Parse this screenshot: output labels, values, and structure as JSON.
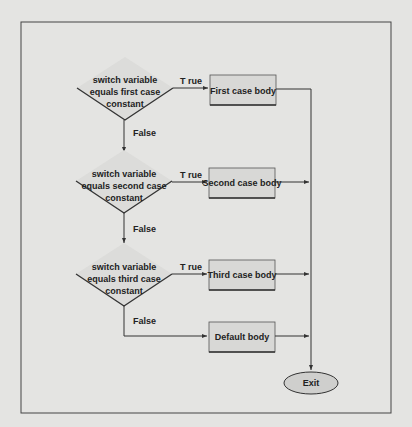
{
  "decisions": [
    {
      "lines": [
        "switch variable",
        "equals first case",
        "constant"
      ],
      "true_label": "T rue",
      "false_label": "False"
    },
    {
      "lines": [
        "switch variable",
        "equals second case",
        "constant"
      ],
      "true_label": "T rue",
      "false_label": "False"
    },
    {
      "lines": [
        "switch variable",
        "equals third case",
        "constant"
      ],
      "true_label": "T rue",
      "false_label": "False"
    }
  ],
  "bodies": [
    "First case body",
    "Second case body",
    "Third case body",
    "Default body"
  ],
  "exit_label": "Exit",
  "colors": {
    "background": "#e4e4e2",
    "line": "#333333",
    "box_fill": "#d8d8d6",
    "ellipse_fill": "#cfcfcd"
  }
}
